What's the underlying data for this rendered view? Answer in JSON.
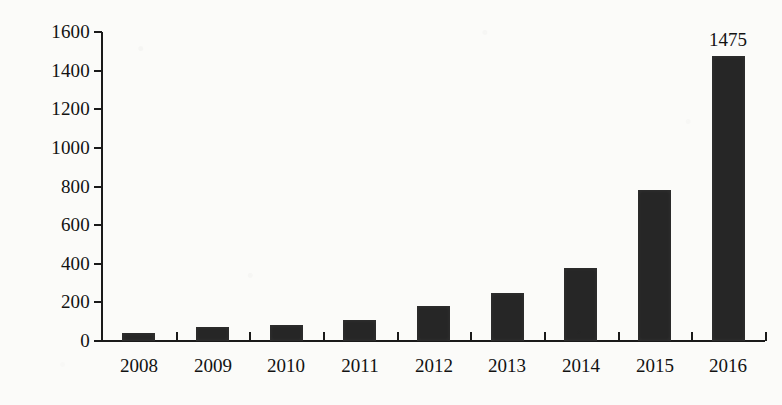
{
  "chart_data": {
    "type": "bar",
    "title": "",
    "subtitle": "",
    "xlabel": "",
    "ylabel": "",
    "categories": [
      "2008",
      "2009",
      "2010",
      "2011",
      "2012",
      "2013",
      "2014",
      "2015",
      "2016"
    ],
    "values": [
      40,
      70,
      85,
      110,
      180,
      250,
      380,
      780,
      1475
    ],
    "data_labels": [
      "",
      "",
      "",
      "",
      "",
      "",
      "",
      "",
      "1475"
    ],
    "ylim": [
      0,
      1600
    ],
    "y_ticks": [
      0,
      200,
      400,
      600,
      800,
      1000,
      1200,
      1400,
      1600
    ],
    "y_tick_labels": [
      "0",
      "200",
      "400",
      "600",
      "800",
      "1000",
      "1200",
      "1400",
      "1600"
    ],
    "grid": false,
    "legend": false,
    "legend_position": "none",
    "series": [
      {
        "name": "",
        "values": [
          40,
          70,
          85,
          110,
          180,
          250,
          380,
          780,
          1475
        ]
      }
    ],
    "colors": {
      "bar": "#262626",
      "axis": "#1a1a1a",
      "text": "#121212",
      "background": "#fbfbf9"
    }
  }
}
